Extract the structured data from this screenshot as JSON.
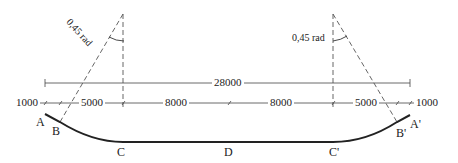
{
  "diagram": {
    "overall_dimension": "28000",
    "segment_dimensions": [
      "1000",
      "5000",
      "8000",
      "8000",
      "5000",
      "1000"
    ],
    "angle_left": "0,45 rad",
    "angle_right": "0,45 rad",
    "points": {
      "A": "A",
      "B": "B",
      "C": "C",
      "D": "D",
      "C_prime": "C'",
      "B_prime": "B'",
      "A_prime": "A'"
    },
    "colors": {
      "line": "#222222",
      "dashed": "#555555",
      "dimension": "#444444"
    }
  }
}
